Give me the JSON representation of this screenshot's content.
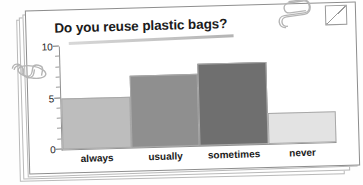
{
  "card": {
    "title": "Do you reuse plastic bags?"
  },
  "decorations": {
    "paperclip_top": "paperclip-icon",
    "paperclip_left": "paperclip-icon",
    "folded_corner": "folded-corner-icon"
  },
  "chart_data": {
    "type": "bar",
    "title": "Do you reuse plastic bags?",
    "xlabel": "",
    "ylabel": "",
    "categories": [
      "always",
      "usually",
      "sometimes",
      "never"
    ],
    "values": [
      5,
      7,
      8,
      3
    ],
    "ylim": [
      0,
      10
    ],
    "yticks": [
      0,
      5,
      10
    ],
    "ytick_labels": [
      "0",
      "5",
      "10"
    ],
    "minor_tick_step": 1,
    "grid": false,
    "legend": null,
    "bar_colors": [
      "#bdbdbd",
      "#8f8f8f",
      "#6f6f6f",
      "#e3e3e3"
    ]
  }
}
